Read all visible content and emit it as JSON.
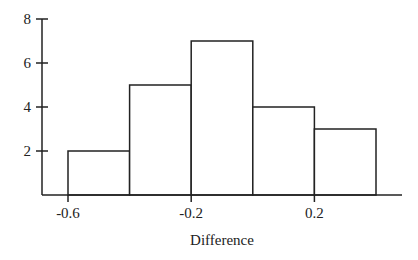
{
  "chart_data": {
    "type": "bar",
    "subtype": "histogram",
    "title": "",
    "xlabel": "Difference",
    "ylabel": "",
    "bin_edges": [
      -0.6,
      -0.4,
      -0.2,
      0.0,
      0.2,
      0.4
    ],
    "categories": [
      "-0.6 to -0.4",
      "-0.4 to -0.2",
      "-0.2 to 0.0",
      "0.0 to 0.2",
      "0.2 to 0.4"
    ],
    "values": [
      2,
      5,
      7,
      4,
      3
    ],
    "xticks": [
      -0.6,
      -0.2,
      0.2
    ],
    "xtick_labels": [
      "-0.6",
      "-0.2",
      "0.2"
    ],
    "yticks": [
      2,
      4,
      6,
      8
    ],
    "ytick_labels": [
      "2",
      "4",
      "6",
      "8"
    ],
    "ylim": [
      0,
      8
    ],
    "grid": false,
    "legend": null,
    "bar_fill": "#ffffff",
    "bar_stroke": "#222222"
  }
}
